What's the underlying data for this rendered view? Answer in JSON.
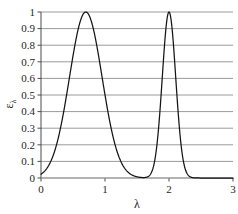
{
  "chart_data": {
    "type": "line",
    "title": "",
    "xlabel": "λ",
    "ylabel": "ε",
    "ylabel_sub": "λ",
    "xlim": [
      0,
      3
    ],
    "ylim": [
      0,
      1
    ],
    "grid": true,
    "grid_axis": "y",
    "legend": false,
    "xticks": [
      0,
      1,
      2,
      3
    ],
    "xticklabels": [
      "0",
      "1",
      "2",
      "3"
    ],
    "yticks": [
      0,
      0.1,
      0.2,
      0.3,
      0.4,
      0.5,
      0.6,
      0.7,
      0.8,
      0.9,
      1
    ],
    "yticklabels": [
      "0",
      "0.1",
      "0.2",
      "0.3",
      "0.4",
      "0.5",
      "0.6",
      "0.7",
      "0.8",
      "0.9",
      "1"
    ],
    "series": [
      {
        "name": "spectral-emissivity",
        "color": "#141414",
        "peaks": [
          {
            "center": 0.7,
            "height": 1.0,
            "sigma": 0.255
          },
          {
            "center": 2.0,
            "height": 1.0,
            "sigma": 0.105
          }
        ],
        "x": [
          0.0,
          0.05,
          0.1,
          0.15,
          0.2,
          0.25,
          0.3,
          0.35,
          0.4,
          0.45,
          0.5,
          0.55,
          0.6,
          0.65,
          0.7,
          0.75,
          0.8,
          0.85,
          0.9,
          0.95,
          1.0,
          1.05,
          1.1,
          1.15,
          1.2,
          1.25,
          1.3,
          1.35,
          1.4,
          1.45,
          1.5,
          1.55,
          1.6,
          1.65,
          1.7,
          1.75,
          1.8,
          1.85,
          1.9,
          1.95,
          2.0,
          2.05,
          2.1,
          2.15,
          2.2,
          2.25,
          2.3,
          2.35,
          2.4,
          2.5,
          2.6,
          2.8,
          3.0
        ],
        "y": [
          0.014,
          0.023,
          0.037,
          0.057,
          0.085,
          0.123,
          0.172,
          0.232,
          0.302,
          0.38,
          0.462,
          0.545,
          0.662,
          0.826,
          1.0,
          0.826,
          0.662,
          0.545,
          0.462,
          0.38,
          0.302,
          0.232,
          0.172,
          0.123,
          0.085,
          0.057,
          0.037,
          0.023,
          0.014,
          0.008,
          0.005,
          0.008,
          0.014,
          0.023,
          0.05,
          0.103,
          0.204,
          0.372,
          0.596,
          0.895,
          1.0,
          0.895,
          0.596,
          0.372,
          0.204,
          0.103,
          0.05,
          0.018,
          0.007,
          0.002,
          0.0,
          0.0,
          0.0
        ]
      }
    ]
  },
  "style": {
    "grid_color": "#9a9a9a",
    "axis_color": "#4a4a4a",
    "curve_color": "#141414",
    "text_color": "#262626",
    "background": "#ffffff"
  },
  "plot_geometry": {
    "left": 41,
    "right": 233,
    "top": 12,
    "bottom": 178
  }
}
